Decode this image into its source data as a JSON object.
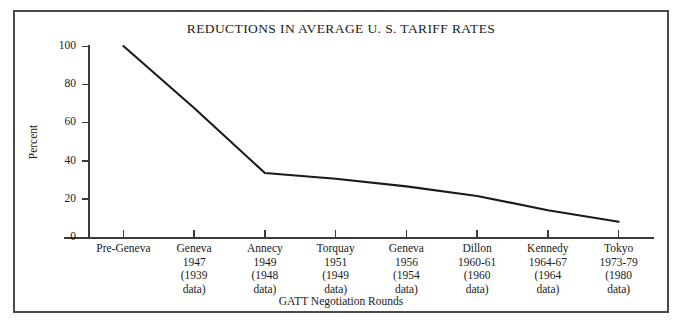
{
  "chart_data": {
    "type": "line",
    "title": "REDUCTIONS IN AVERAGE U. S. TARIFF RATES",
    "xlabel": "GATT Negotiation Rounds",
    "ylabel": "Percent",
    "ylim": [
      0,
      100
    ],
    "yticks": [
      0,
      20,
      40,
      60,
      80,
      100
    ],
    "ytick_labels": [
      "0",
      "20",
      "40",
      "60",
      "80",
      "100"
    ],
    "grid": false,
    "legend": null,
    "categories": [
      "Pre-Geneva",
      "Geneva 1947",
      "Annecy 1949",
      "Torquay 1951",
      "Geneva 1956",
      "Dillon 1960-61",
      "Kennedy 1964-67",
      "Tokyo 1973-79"
    ],
    "values": [
      100,
      67.5,
      33.5,
      30.5,
      26.5,
      21.5,
      14,
      8
    ],
    "series": [
      {
        "name": "Average U.S. tariff rate",
        "values": [
          100,
          67.5,
          33.5,
          30.5,
          26.5,
          21.5,
          14,
          8
        ],
        "color": "#1a1a1a"
      }
    ]
  },
  "axis": {
    "y_label": "Percent",
    "x_caption": "GATT Negotiation Rounds",
    "y_ticks": [
      {
        "label": "100",
        "value": 100
      },
      {
        "label": "80",
        "value": 80
      },
      {
        "label": "60",
        "value": 60
      },
      {
        "label": "40",
        "value": 40
      },
      {
        "label": "20",
        "value": 20
      },
      {
        "label": "0",
        "value": 0
      }
    ],
    "x_categories": [
      {
        "name": "Pre-Geneva",
        "year": "",
        "data_year": "",
        "data_word": ""
      },
      {
        "name": "Geneva",
        "year": "1947",
        "data_year": "(1939",
        "data_word": "data)"
      },
      {
        "name": "Annecy",
        "year": "1949",
        "data_year": "(1948",
        "data_word": "data)"
      },
      {
        "name": "Torquay",
        "year": "1951",
        "data_year": "(1949",
        "data_word": "data)"
      },
      {
        "name": "Geneva",
        "year": "1956",
        "data_year": "(1954",
        "data_word": "data)"
      },
      {
        "name": "Dillon",
        "year": "1960-61",
        "data_year": "(1960",
        "data_word": "data)"
      },
      {
        "name": "Kennedy",
        "year": "1964-67",
        "data_year": "(1964",
        "data_word": "data)"
      },
      {
        "name": "Tokyo",
        "year": "1973-79",
        "data_year": "(1980",
        "data_word": "data)"
      }
    ]
  },
  "title": {
    "text": "REDUCTIONS IN AVERAGE U. S. TARIFF RATES"
  },
  "colors": {
    "frame": "#4a4a4a",
    "axis": "#3a3a3a",
    "line": "#1a1a1a",
    "text": "#1a1a1a",
    "background": "#ffffff"
  }
}
